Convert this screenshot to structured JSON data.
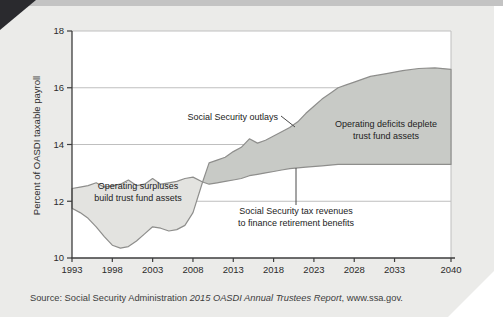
{
  "page": {
    "source": {
      "prefix": "Source: Social Security Administration ",
      "italic": "2015 OASDI Annual Trustees Report",
      "suffix": ", www.ssa.gov."
    }
  },
  "chart_data": {
    "type": "area",
    "title": "",
    "xlabel": "",
    "ylabel": "Percent of OASDI taxable payroll",
    "xlim": [
      1993,
      2040
    ],
    "ylim": [
      10,
      18
    ],
    "yticks": [
      10,
      12,
      14,
      16,
      18
    ],
    "xticks": [
      1993,
      1998,
      2003,
      2008,
      2013,
      2018,
      2023,
      2028,
      2033,
      2040
    ],
    "grid": "horizontal",
    "legend": "annotated-on-chart",
    "crossover_year": 2009.2,
    "series": [
      {
        "name": "Social Security outlays",
        "x": [
          1993,
          1994,
          1995,
          1996,
          1997,
          1998,
          1999,
          2000,
          2001,
          2002,
          2003,
          2004,
          2005,
          2006,
          2007,
          2008,
          2009.2,
          2010,
          2011,
          2012,
          2013,
          2014,
          2015,
          2016,
          2017,
          2018,
          2019,
          2020,
          2021,
          2022,
          2023,
          2024,
          2025,
          2026,
          2027,
          2028,
          2030,
          2032,
          2034,
          2036,
          2038,
          2040
        ],
        "values": [
          11.75,
          11.6,
          11.4,
          11.1,
          10.75,
          10.45,
          10.35,
          10.4,
          10.6,
          10.85,
          11.1,
          11.05,
          10.95,
          11.0,
          11.15,
          11.6,
          12.68,
          13.35,
          13.45,
          13.55,
          13.75,
          13.9,
          14.2,
          14.05,
          14.15,
          14.3,
          14.45,
          14.6,
          14.8,
          15.1,
          15.35,
          15.6,
          15.8,
          16.0,
          16.1,
          16.2,
          16.4,
          16.5,
          16.6,
          16.68,
          16.7,
          16.65
        ]
      },
      {
        "name": "Social Security tax revenues to finance retirement benefits",
        "x": [
          1993,
          1994,
          1995,
          1996,
          1997,
          1998,
          1999,
          2000,
          2001,
          2002,
          2003,
          2004,
          2005,
          2006,
          2007,
          2008,
          2009.2,
          2010,
          2011,
          2012,
          2013,
          2014,
          2015,
          2016,
          2017,
          2018,
          2019,
          2020,
          2022,
          2024,
          2026,
          2030,
          2035,
          2040
        ],
        "values": [
          12.45,
          12.5,
          12.55,
          12.65,
          12.5,
          12.55,
          12.6,
          12.75,
          12.55,
          12.6,
          12.8,
          12.6,
          12.65,
          12.7,
          12.8,
          12.85,
          12.68,
          12.6,
          12.65,
          12.7,
          12.75,
          12.8,
          12.9,
          12.95,
          13.0,
          13.05,
          13.1,
          13.15,
          13.2,
          13.25,
          13.3,
          13.3,
          13.3,
          13.3
        ]
      }
    ],
    "labels": {
      "outlays": "Social Security outlays",
      "surplus_line1": "Operating surpluses",
      "surplus_line2": "build trust fund assets",
      "revenues_line1": "Social Security tax revenues",
      "revenues_line2": "to finance retirement benefits",
      "deficit_line1": "Operating deficits deplete",
      "deficit_line2": "trust fund assets"
    },
    "colors": {
      "surplus_fill": "#e3e3e0",
      "deficit_fill": "#c8cac6",
      "area_outline": "#8e8e8c",
      "axis": "#3d3d3d",
      "grid": "#bfbfbf",
      "plot_background": "#ffffff"
    }
  }
}
